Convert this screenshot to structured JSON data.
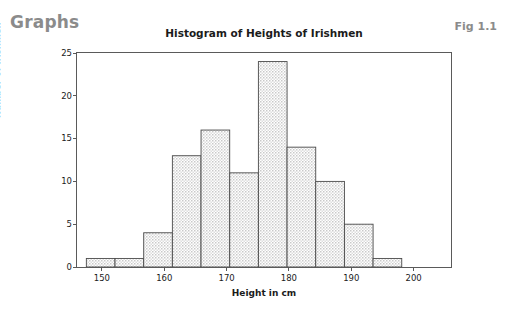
{
  "page": {
    "heading": "Graphs",
    "figure_label": "Fig 1.1"
  },
  "chart_data": {
    "type": "bar",
    "subtype": "histogram",
    "title": "Histogram of Heights of Irishmen",
    "xlabel": "Height in cm",
    "ylabel": "Number of Irishmen",
    "xlim": [
      146,
      206
    ],
    "ylim": [
      0,
      25
    ],
    "grid": false,
    "legend": null,
    "xticks": [
      150,
      160,
      170,
      180,
      190,
      200
    ],
    "yticks": [
      0,
      5,
      10,
      15,
      20,
      25
    ],
    "bin_edges": [
      147.5,
      152.1,
      156.7,
      161.3,
      165.9,
      170.5,
      175.1,
      179.7,
      184.3,
      188.9,
      193.5,
      198.1,
      202.7
    ],
    "bin_centers": [
      149.8,
      154.4,
      159.0,
      163.6,
      168.2,
      172.8,
      177.4,
      182.0,
      186.6,
      191.2,
      195.8,
      200.4
    ],
    "values": [
      1,
      1,
      4,
      13,
      16,
      11,
      24,
      14,
      10,
      5,
      1
    ],
    "bars": [
      {
        "x0": 147.5,
        "x1": 152.1,
        "count": 1
      },
      {
        "x0": 152.1,
        "x1": 156.7,
        "count": 1
      },
      {
        "x0": 156.7,
        "x1": 161.3,
        "count": 4
      },
      {
        "x0": 161.3,
        "x1": 165.9,
        "count": 13
      },
      {
        "x0": 165.9,
        "x1": 170.5,
        "count": 16
      },
      {
        "x0": 170.5,
        "x1": 175.1,
        "count": 11
      },
      {
        "x0": 175.1,
        "x1": 179.7,
        "count": 24
      },
      {
        "x0": 179.7,
        "x1": 184.3,
        "count": 14
      },
      {
        "x0": 184.3,
        "x1": 188.9,
        "count": 10
      },
      {
        "x0": 188.9,
        "x1": 193.5,
        "count": 5
      },
      {
        "x0": 193.5,
        "x1": 198.1,
        "count": 1
      }
    ],
    "colors": {
      "bar_fill": "#d9d9d9",
      "bar_edge": "#4a4a4a",
      "axis": "#5a5a5a",
      "text": "#1b1b1b",
      "heading": "#8b8b8b",
      "background": "#ffffff"
    }
  }
}
